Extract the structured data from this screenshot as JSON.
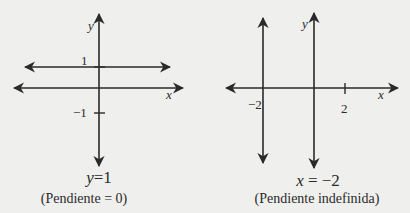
{
  "left_graph": {
    "axis_x_label": "x",
    "axis_y_label": "y",
    "tick_pos_label": "1",
    "tick_neg_label": "−1",
    "equation": "y = 1",
    "equation_var": "y",
    "equation_rest": "=1",
    "caption": "(Pendiente = 0)"
  },
  "right_graph": {
    "axis_x_label": "x",
    "axis_y_label": "y",
    "tick_neg_label": "−2",
    "tick_pos_label": "2",
    "equation": "x = −2",
    "equation_var": "x",
    "equation_rest": " = −2",
    "caption": "(Pendiente indefinida)"
  },
  "colors": {
    "background": "#efefed",
    "ink": "#2a2a2a"
  }
}
